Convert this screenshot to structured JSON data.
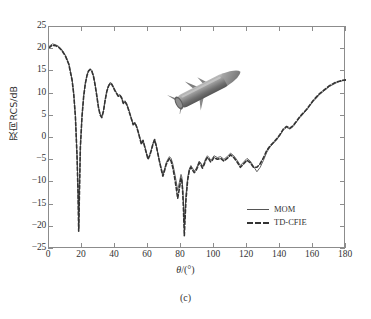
{
  "figure": {
    "caption": "(c)",
    "inset_icon": "missile-3d-model"
  },
  "axes": {
    "x_title_symbol": "θ",
    "x_title_unit": "/(°)",
    "y_title": "双向RCS/dB",
    "x_ticks": [
      "0",
      "20",
      "40",
      "60",
      "80",
      "100",
      "120",
      "140",
      "160",
      "180"
    ],
    "y_ticks": [
      "25",
      "20",
      "15",
      "10",
      "5",
      "0",
      "−5",
      "−10",
      "−15",
      "−20",
      "−25"
    ]
  },
  "legend": {
    "entries": [
      {
        "label": "MOM",
        "style": "solid",
        "color": "#555555"
      },
      {
        "label": "TD-CFIE",
        "style": "dashed",
        "color": "#333333"
      }
    ]
  },
  "chart_data": {
    "type": "line",
    "title": "",
    "xlabel": "θ/(°)",
    "ylabel": "双向RCS/dB",
    "xlim": [
      0,
      180
    ],
    "ylim": [
      -25,
      25
    ],
    "xticks": [
      0,
      20,
      40,
      60,
      80,
      100,
      120,
      140,
      160,
      180
    ],
    "yticks": [
      -25,
      -20,
      -15,
      -10,
      -5,
      0,
      5,
      10,
      15,
      20,
      25
    ],
    "grid": false,
    "legend_position": "lower-right",
    "series": [
      {
        "name": "MOM",
        "style": "solid",
        "color": "#555555",
        "x": [
          0,
          2,
          4,
          6,
          8,
          10,
          12,
          14,
          15,
          16,
          17,
          17.6,
          18,
          18.4,
          19,
          20,
          21,
          22,
          23,
          24,
          25,
          26,
          27,
          28,
          29,
          30,
          31,
          32,
          33,
          34,
          35,
          36,
          37,
          38,
          39,
          40,
          41,
          42,
          43,
          44,
          45,
          46,
          47,
          48,
          49,
          50,
          51,
          52,
          53,
          54,
          55,
          56,
          57,
          58,
          59,
          60,
          61,
          62,
          63,
          64,
          65,
          66,
          67,
          68,
          69,
          70,
          71,
          72,
          73,
          74,
          75,
          76,
          77,
          78,
          79,
          80,
          80.5,
          81,
          81.5,
          82,
          83,
          84,
          85,
          86,
          87,
          88,
          89,
          90,
          91,
          92,
          93,
          94,
          95,
          96,
          97,
          98,
          99,
          100,
          102,
          104,
          106,
          108,
          110,
          112,
          114,
          116,
          118,
          120,
          122,
          124,
          126,
          128,
          130,
          132,
          134,
          136,
          138,
          140,
          142,
          144,
          146,
          148,
          150,
          152,
          154,
          156,
          158,
          160,
          162,
          164,
          166,
          168,
          170,
          172,
          174,
          176,
          178,
          180
        ],
        "y": [
          20.6,
          21.2,
          21.0,
          20.6,
          19.8,
          18.6,
          16.8,
          13.2,
          10.0,
          5.0,
          -4.0,
          -12.0,
          -20.5,
          -13.0,
          -2.0,
          5.0,
          9.5,
          12.4,
          14.2,
          15.3,
          15.6,
          15.2,
          14.0,
          12.0,
          9.6,
          7.0,
          5.4,
          4.8,
          6.2,
          8.6,
          10.6,
          11.8,
          12.5,
          12.3,
          11.6,
          10.8,
          10.2,
          9.6,
          9.8,
          9.2,
          8.0,
          8.4,
          7.8,
          6.8,
          5.6,
          4.4,
          3.2,
          3.6,
          2.8,
          1.6,
          0.2,
          -1.2,
          -0.4,
          -1.8,
          -3.2,
          -4.6,
          -3.8,
          -2.6,
          -1.2,
          -0.2,
          -1.6,
          -3.4,
          -5.2,
          -6.8,
          -8.2,
          -7.0,
          -5.6,
          -4.8,
          -4.2,
          -4.6,
          -5.8,
          -7.6,
          -9.6,
          -11.8,
          -10.0,
          -8.2,
          -8.8,
          -11.0,
          -14.2,
          -19.6,
          -13.0,
          -9.0,
          -7.0,
          -6.2,
          -6.8,
          -7.4,
          -7.0,
          -6.2,
          -5.2,
          -5.6,
          -6.4,
          -5.6,
          -4.6,
          -4.0,
          -4.4,
          -5.0,
          -4.6,
          -4.0,
          -4.4,
          -4.2,
          -4.8,
          -4.2,
          -3.4,
          -4.0,
          -5.0,
          -6.2,
          -5.4,
          -4.6,
          -5.2,
          -6.4,
          -7.6,
          -6.6,
          -5.0,
          -3.2,
          -2.0,
          -1.2,
          -0.4,
          0.6,
          1.8,
          2.4,
          2.0,
          2.6,
          3.6,
          4.6,
          5.4,
          6.2,
          7.2,
          8.2,
          9.0,
          9.8,
          10.4,
          11.0,
          11.6,
          12.0,
          12.4,
          12.7,
          12.9,
          13.0
        ]
      },
      {
        "name": "TD-CFIE",
        "style": "dashed",
        "color": "#333333",
        "x": [
          0,
          2,
          4,
          6,
          8,
          10,
          12,
          14,
          15,
          16,
          17,
          17.6,
          18,
          18.4,
          19,
          20,
          21,
          22,
          23,
          24,
          25,
          26,
          27,
          28,
          29,
          30,
          31,
          32,
          33,
          34,
          35,
          36,
          37,
          38,
          39,
          40,
          41,
          42,
          43,
          44,
          45,
          46,
          47,
          48,
          49,
          50,
          51,
          52,
          53,
          54,
          55,
          56,
          57,
          58,
          59,
          60,
          61,
          62,
          63,
          64,
          65,
          66,
          67,
          68,
          69,
          70,
          71,
          72,
          73,
          74,
          75,
          76,
          77,
          78,
          79,
          80,
          80.5,
          81,
          81.5,
          82,
          83,
          84,
          85,
          86,
          87,
          88,
          89,
          90,
          91,
          92,
          93,
          94,
          95,
          96,
          97,
          98,
          99,
          100,
          102,
          104,
          106,
          108,
          110,
          112,
          114,
          116,
          118,
          120,
          122,
          124,
          126,
          128,
          130,
          132,
          134,
          136,
          138,
          140,
          142,
          144,
          146,
          148,
          150,
          152,
          154,
          156,
          158,
          160,
          162,
          164,
          166,
          168,
          170,
          172,
          174,
          176,
          178,
          180
        ],
        "y": [
          20.3,
          20.9,
          20.8,
          20.4,
          19.6,
          18.4,
          16.6,
          13.0,
          9.8,
          4.8,
          -4.2,
          -12.4,
          -21.0,
          -13.4,
          -2.2,
          4.8,
          9.3,
          12.2,
          14.0,
          15.1,
          15.4,
          15.0,
          13.8,
          11.8,
          9.4,
          6.8,
          5.2,
          4.6,
          6.0,
          8.4,
          10.4,
          11.6,
          12.3,
          12.1,
          11.4,
          10.6,
          10.0,
          9.4,
          9.6,
          9.0,
          7.8,
          8.2,
          7.6,
          6.6,
          5.4,
          4.2,
          3.0,
          3.4,
          2.6,
          1.4,
          0.0,
          -1.4,
          -0.6,
          -2.0,
          -3.4,
          -4.8,
          -4.0,
          -2.8,
          -1.4,
          -0.4,
          -1.8,
          -3.6,
          -5.4,
          -7.0,
          -8.6,
          -7.4,
          -6.0,
          -5.2,
          -4.6,
          -5.2,
          -6.6,
          -8.6,
          -11.0,
          -13.6,
          -11.4,
          -9.0,
          -9.6,
          -12.0,
          -16.0,
          -22.0,
          -14.0,
          -9.6,
          -7.4,
          -6.6,
          -7.2,
          -7.8,
          -7.4,
          -6.6,
          -5.6,
          -6.0,
          -6.8,
          -6.0,
          -5.0,
          -4.4,
          -4.8,
          -5.4,
          -5.0,
          -4.4,
          -4.8,
          -4.6,
          -5.2,
          -4.6,
          -3.8,
          -4.4,
          -5.4,
          -6.6,
          -5.8,
          -5.0,
          -5.6,
          -6.6,
          -6.6,
          -5.8,
          -4.4,
          -2.8,
          -1.8,
          -1.0,
          -0.2,
          0.8,
          2.0,
          2.6,
          2.2,
          2.8,
          3.8,
          4.8,
          5.6,
          6.4,
          7.4,
          8.4,
          9.2,
          10.0,
          10.6,
          11.2,
          11.8,
          12.2,
          12.6,
          12.8,
          13.0,
          13.1
        ]
      }
    ]
  }
}
